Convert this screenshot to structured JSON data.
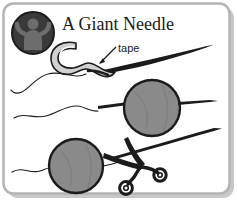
{
  "illustration": {
    "title": "A Giant Needle",
    "annotation_label": "tape",
    "frame": {
      "border_color": "#b4b4b4",
      "shadow_color": "#c8c8c8",
      "background_color": "#ffffff",
      "corner_radius": 10
    },
    "badge": {
      "name": "person-figure-badge",
      "fill_color": "#3a3a3a",
      "outline_color": "#1b1b1b",
      "figure_color": "#6d6d6d",
      "center_x": 33,
      "center_y": 33,
      "radius": 21
    },
    "ink_color": "#1b1b1b",
    "tape_fill_color": "#d0d0d0",
    "sphere_fill_color": "#8a8a8a",
    "sphere_shade_color": "#707070",
    "sphere_outline_color": "#1b1b1b",
    "spheres": [
      {
        "name": "needle-sphere-upper",
        "center_x": 152,
        "center_y": 108,
        "radius": 28
      },
      {
        "name": "needle-sphere-lower",
        "center_x": 76,
        "center_y": 166,
        "radius": 27
      }
    ],
    "steps": [
      "needle-with-tape-hook",
      "needle-through-sphere",
      "scissors-cutting-thread"
    ]
  }
}
